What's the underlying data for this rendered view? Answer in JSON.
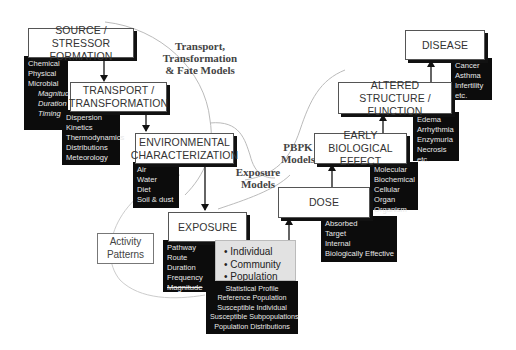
{
  "boxes": {
    "source": {
      "title_line1": "SOURCE / STRESSOR",
      "title_line2": "FORMATION",
      "items": [
        "Chemical",
        "Physical",
        "Microbial"
      ],
      "sub_items": [
        "Magnitude",
        "Duration",
        "Timing"
      ]
    },
    "transport": {
      "title_line1": "TRANSPORT /",
      "title_line2": "TRANSFORMATION",
      "items": [
        "Dispersion",
        "Kinetics",
        "Thermodynamics",
        "Distributions",
        "Meteorology"
      ]
    },
    "environmental": {
      "title_line1": "ENVIRONMENTAL",
      "title_line2": "CHARACTERIZATION",
      "items": [
        "Air",
        "Water",
        "Diet",
        "Soil & dust"
      ]
    },
    "exposure": {
      "title": "EXPOSURE",
      "items": [
        "Pathway",
        "Route",
        "Duration",
        "Frequency",
        "Magnitude"
      ]
    },
    "population": {
      "items": [
        "Individual",
        "Community",
        "Population"
      ],
      "bullet": "•"
    },
    "statistics": {
      "items": [
        "Statistical Profile",
        "Reference Population",
        "Susceptible Individual",
        "Susceptible Subpopulations",
        "Population Distributions"
      ]
    },
    "activity": {
      "title_line1": "Activity",
      "title_line2": "Patterns"
    },
    "dose": {
      "title": "DOSE",
      "items": [
        "Absorbed",
        "Target",
        "Internal",
        "Biologically Effective"
      ]
    },
    "early_effect": {
      "title_line1": "EARLY BIOLOGICAL",
      "title_line2": "EFFECT",
      "items": [
        "Molecular",
        "Biochemical",
        "Cellular",
        "Organ",
        "Organism"
      ]
    },
    "altered": {
      "title_line1": "ALTERED STRUCTURE /",
      "title_line2": "FUNCTION",
      "items": [
        "Edema",
        "Arrhythmia",
        "Enzymuria",
        "Necrosis",
        "etc."
      ]
    },
    "disease": {
      "title": "DISEASE",
      "items": [
        "Cancer",
        "Asthma",
        "Infertility",
        "etc."
      ]
    }
  },
  "model_labels": {
    "transport_models": {
      "line1": "Transport,",
      "line2": "Transformation",
      "line3": "& Fate Models"
    },
    "exposure_models": {
      "line1": "Exposure",
      "line2": "Models"
    },
    "pbpk_models": {
      "line1": "PBPK",
      "line2": "Models"
    }
  },
  "colors": {
    "box_border": "#555555",
    "list_bg": "#0c0c0c",
    "list_text": "#e8e8e8",
    "population_bg": "#e2e2e2",
    "curve": "#bbbbbb"
  }
}
